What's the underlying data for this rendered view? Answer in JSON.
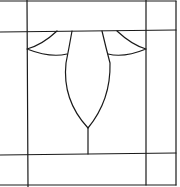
{
  "diagram": {
    "type": "stained-glass-pattern",
    "width": 180,
    "height": 187,
    "stroke_color": "#1a1a1a",
    "background": "#ffffff",
    "frame": {
      "outer": {
        "x1": 0,
        "y1": 1,
        "x2": 176,
        "y2": 185
      },
      "inner_vertical_left_x": 27,
      "inner_vertical_right_x": 146,
      "inner_horizontal_top_y": 31,
      "inner_horizontal_bottom_y": 154
    },
    "motifs": {
      "left_petal": "M57,31 Q42,45 27,49 Q50,58 67,54",
      "right_petal": "M117,31 Q132,45 146,49 Q124,58 108,54",
      "center_leaf": "M72,31 Q69,48 66,63 Q62,100 88,128 Q111,100 110,63 Q106,48 102,31",
      "stem": "M88,128 L88,154"
    }
  }
}
